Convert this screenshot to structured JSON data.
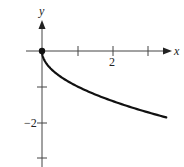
{
  "chart_data": {
    "type": "line",
    "title": "",
    "function": "y = -sqrt(x)",
    "xlabel": "x",
    "ylabel": "y",
    "xlim": [
      0,
      3.6
    ],
    "ylim": [
      -3.1,
      0.85
    ],
    "x_ticks": [
      1,
      2,
      3
    ],
    "x_tick_labels": [
      "",
      "2",
      ""
    ],
    "y_ticks": [
      -1,
      -2,
      -3
    ],
    "y_tick_labels": [
      "",
      "−2",
      ""
    ],
    "grid": false,
    "legend": null,
    "series": [
      {
        "name": "y = -√x",
        "x": [
          0,
          0.05,
          0.1,
          0.25,
          0.5,
          0.75,
          1,
          1.5,
          2,
          2.5,
          3,
          3.5
        ],
        "y": [
          0,
          -0.22,
          -0.32,
          -0.5,
          -0.71,
          -0.87,
          -1,
          -1.22,
          -1.41,
          -1.58,
          -1.73,
          -1.87
        ]
      }
    ],
    "annotations": [
      {
        "type": "closed-point",
        "x": 0,
        "y": 0
      }
    ]
  },
  "axes": {
    "x_label": "x",
    "y_label": "y",
    "x_tick_label_2": "2",
    "y_tick_label_neg2": "−2"
  },
  "colors": {
    "axis": "#444444",
    "curve": "#111111",
    "background": "#ffffff"
  }
}
